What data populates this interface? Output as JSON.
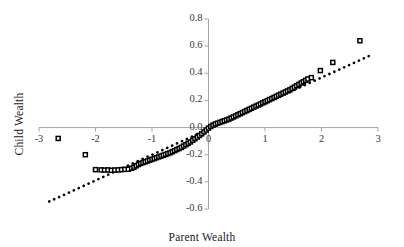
{
  "chart_data": {
    "type": "scatter",
    "title": "",
    "subtitle": "",
    "xlabel": "Parent Wealth",
    "ylabel": "Child Wealth",
    "xlim": [
      -3,
      3
    ],
    "ylim": [
      -0.6,
      0.8
    ],
    "xticks": [
      -3,
      -2,
      -1,
      0,
      1,
      2,
      3
    ],
    "xtick_labels": [
      "-3",
      "-2",
      "-1",
      "0",
      "1",
      "2",
      "3"
    ],
    "yticks": [
      -0.6,
      -0.4,
      -0.2,
      0.0,
      0.2,
      0.4,
      0.6,
      0.8
    ],
    "ytick_labels": [
      "-0.6",
      "-0.4",
      "-0.2",
      "0.0",
      "0.2",
      "0.4",
      "0.6",
      "0.8"
    ],
    "grid": false,
    "legend": null,
    "marker": {
      "shape": "square-open",
      "edge_color": "#000000",
      "face_color": "#ffffff",
      "size": 4
    },
    "series": [
      {
        "name": "Observed quantiles",
        "type": "scatter",
        "points": [
          [
            -2.66,
            -0.08
          ],
          [
            -2.18,
            -0.2
          ],
          [
            -2.0,
            -0.31
          ],
          [
            -1.9,
            -0.312
          ],
          [
            -1.84,
            -0.313
          ],
          [
            -1.78,
            -0.312
          ],
          [
            -1.72,
            -0.315
          ],
          [
            -1.66,
            -0.313
          ],
          [
            -1.6,
            -0.312
          ],
          [
            -1.54,
            -0.31
          ],
          [
            -1.48,
            -0.308
          ],
          [
            -1.42,
            -0.307
          ],
          [
            -1.36,
            -0.3
          ],
          [
            -1.32,
            -0.292
          ],
          [
            -1.28,
            -0.282
          ],
          [
            -1.24,
            -0.272
          ],
          [
            -1.2,
            -0.264
          ],
          [
            -1.16,
            -0.258
          ],
          [
            -1.12,
            -0.252
          ],
          [
            -1.08,
            -0.246
          ],
          [
            -1.04,
            -0.24
          ],
          [
            -1.0,
            -0.234
          ],
          [
            -0.96,
            -0.228
          ],
          [
            -0.92,
            -0.222
          ],
          [
            -0.88,
            -0.216
          ],
          [
            -0.84,
            -0.21
          ],
          [
            -0.8,
            -0.204
          ],
          [
            -0.76,
            -0.198
          ],
          [
            -0.72,
            -0.192
          ],
          [
            -0.68,
            -0.186
          ],
          [
            -0.64,
            -0.178
          ],
          [
            -0.6,
            -0.17
          ],
          [
            -0.56,
            -0.162
          ],
          [
            -0.52,
            -0.154
          ],
          [
            -0.48,
            -0.146
          ],
          [
            -0.44,
            -0.136
          ],
          [
            -0.4,
            -0.126
          ],
          [
            -0.36,
            -0.116
          ],
          [
            -0.32,
            -0.106
          ],
          [
            -0.28,
            -0.094
          ],
          [
            -0.24,
            -0.082
          ],
          [
            -0.2,
            -0.07
          ],
          [
            -0.16,
            -0.058
          ],
          [
            -0.12,
            -0.046
          ],
          [
            -0.08,
            -0.032
          ],
          [
            -0.04,
            -0.018
          ],
          [
            0.0,
            -0.004
          ],
          [
            0.04,
            0.008
          ],
          [
            0.08,
            0.018
          ],
          [
            0.12,
            0.026
          ],
          [
            0.16,
            0.032
          ],
          [
            0.2,
            0.038
          ],
          [
            0.24,
            0.044
          ],
          [
            0.28,
            0.05
          ],
          [
            0.32,
            0.056
          ],
          [
            0.36,
            0.062
          ],
          [
            0.4,
            0.07
          ],
          [
            0.44,
            0.078
          ],
          [
            0.48,
            0.086
          ],
          [
            0.52,
            0.094
          ],
          [
            0.56,
            0.102
          ],
          [
            0.6,
            0.11
          ],
          [
            0.64,
            0.118
          ],
          [
            0.68,
            0.126
          ],
          [
            0.72,
            0.134
          ],
          [
            0.76,
            0.142
          ],
          [
            0.8,
            0.15
          ],
          [
            0.84,
            0.158
          ],
          [
            0.88,
            0.166
          ],
          [
            0.92,
            0.174
          ],
          [
            0.96,
            0.182
          ],
          [
            1.0,
            0.19
          ],
          [
            1.04,
            0.198
          ],
          [
            1.08,
            0.206
          ],
          [
            1.12,
            0.214
          ],
          [
            1.16,
            0.222
          ],
          [
            1.2,
            0.23
          ],
          [
            1.24,
            0.238
          ],
          [
            1.28,
            0.246
          ],
          [
            1.32,
            0.254
          ],
          [
            1.36,
            0.262
          ],
          [
            1.4,
            0.27
          ],
          [
            1.44,
            0.278
          ],
          [
            1.48,
            0.288
          ],
          [
            1.52,
            0.298
          ],
          [
            1.56,
            0.308
          ],
          [
            1.6,
            0.318
          ],
          [
            1.64,
            0.328
          ],
          [
            1.68,
            0.338
          ],
          [
            1.72,
            0.348
          ],
          [
            1.76,
            0.358
          ],
          [
            1.82,
            0.368
          ],
          [
            1.98,
            0.42
          ],
          [
            2.2,
            0.48
          ],
          [
            2.68,
            0.64
          ]
        ]
      },
      {
        "name": "Reference line",
        "type": "line",
        "style": "dotted",
        "color": "#000000",
        "x": [
          -2.82,
          2.88
        ],
        "y": [
          -0.545,
          0.535
        ]
      }
    ]
  },
  "axes": {
    "x_title": "Parent Wealth",
    "y_title": "Child Wealth",
    "axis_color": "#9b9b9b"
  }
}
